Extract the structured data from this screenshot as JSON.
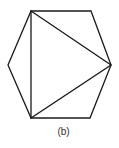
{
  "figure": {
    "caption": "(b)",
    "stroke_color": "#1a1a1a",
    "hexagon": {
      "vertices": [
        [
          31,
          11
        ],
        [
          91,
          11
        ],
        [
          111,
          65
        ],
        [
          90,
          118
        ],
        [
          31,
          118
        ],
        [
          8,
          65
        ]
      ]
    },
    "inscribed_triangle": {
      "vertices": [
        [
          31,
          11
        ],
        [
          111,
          65
        ],
        [
          31,
          118
        ]
      ]
    }
  }
}
